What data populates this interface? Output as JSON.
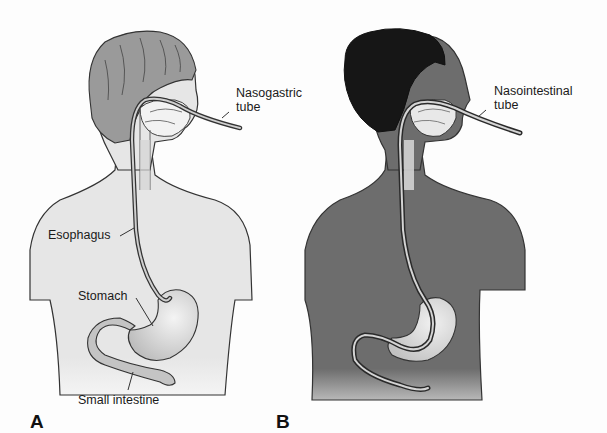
{
  "figure": {
    "panels": [
      {
        "id": "A",
        "letter": "A",
        "tube_label_line1": "Nasogastric",
        "tube_label_line2": "tube",
        "labels": {
          "esophagus": "Esophagus",
          "stomach": "Stomach",
          "small_intestine": "Small intestine"
        },
        "skin_color": "#e6e6e6",
        "hair_color": "#9a9a9a"
      },
      {
        "id": "B",
        "letter": "B",
        "tube_label_line1": "Nasointestinal",
        "tube_label_line2": "tube",
        "skin_color": "#6d6d6d",
        "hair_color": "#161616"
      }
    ]
  }
}
